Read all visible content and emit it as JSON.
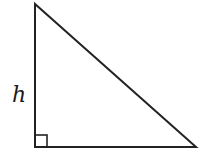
{
  "diagram": {
    "type": "right-triangle",
    "labels": {
      "height": "h"
    },
    "vertices": {
      "top": [
        35,
        4
      ],
      "right_angle": [
        35,
        147
      ],
      "bottom_right": [
        196,
        147
      ]
    },
    "right_angle_marker": true,
    "stroke_color": "#222222"
  }
}
